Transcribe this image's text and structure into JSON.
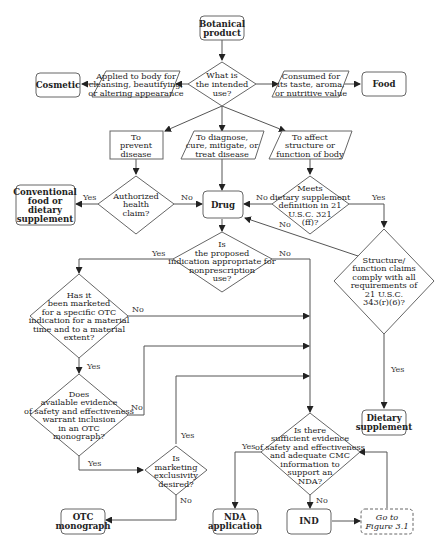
{
  "nodes": {
    "botanical": [
      "Botanical",
      "product"
    ],
    "intended_use": [
      "What is",
      "the intended",
      "use?"
    ],
    "cosmetic_use": [
      "Applied to body for",
      "cleansing, beautifying,",
      "or altering appearance"
    ],
    "cosmetic": [
      "Cosmetic"
    ],
    "food_use": [
      "Consumed for",
      "its taste, aroma,",
      "or nutritive value"
    ],
    "food": [
      "Food"
    ],
    "prevent": [
      "To",
      "prevent",
      "disease"
    ],
    "diagnose": [
      "To diagnose,",
      "cure, mitigate, or",
      "treat disease"
    ],
    "affect": [
      "To affect",
      "structure or",
      "function of body"
    ],
    "conventional": [
      "Conventional",
      "food or",
      "dietary",
      "supplement"
    ],
    "health_claim": [
      "Authorized",
      "health",
      "claim?"
    ],
    "drug": [
      "Drug"
    ],
    "meets_ds": [
      "Meets",
      "dietary supplement",
      "definition in 21",
      "U.S.C. 321",
      "(ff)?"
    ],
    "nonrx": [
      "Is",
      "the proposed",
      "indication appropriate for",
      "nonprescription",
      "use?"
    ],
    "structure_claims": [
      "Structure/",
      "function claims",
      "comply with all",
      "requirements of",
      "21 U.S.C.",
      "343(r)(6)?"
    ],
    "marketed_otc": [
      "Has it",
      "been marketed",
      "for a specific OTC",
      "indication for a material",
      "time and to a material",
      "extent?"
    ],
    "evidence_otc": [
      "Does",
      "available evidence",
      "of safety and effectiveness",
      "warrant inclusion",
      "in an OTC",
      "monograph?"
    ],
    "exclusivity": [
      "Is",
      "marketing",
      "exclusivity",
      "desired?"
    ],
    "sufficient_nda": [
      "Is there",
      "sufficient evidence",
      "of safety and effectiveness",
      "and adequate CMC",
      "information to",
      "support an",
      "NDA?"
    ],
    "dietary_supplement": [
      "Dietary",
      "supplement"
    ],
    "otc_monograph": [
      "OTC",
      "monograph"
    ],
    "nda_application": [
      "NDA",
      "application"
    ],
    "ind": [
      "IND"
    ],
    "goto": [
      "Go to",
      "Figure 3.1"
    ]
  },
  "labels": {
    "yes": "Yes",
    "no": "No"
  }
}
